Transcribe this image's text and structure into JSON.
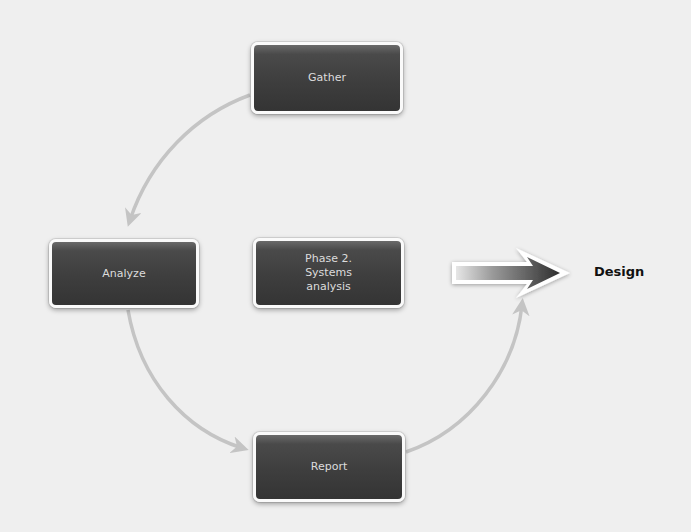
{
  "diagram": {
    "nodes": [
      {
        "id": "gather",
        "label": "Gather"
      },
      {
        "id": "analyze",
        "label": "Analyze"
      },
      {
        "id": "phase",
        "label": "Phase 2. Systems analysis",
        "lines": [
          "Phase 2.",
          "Systems",
          "analysis"
        ]
      },
      {
        "id": "report",
        "label": "Report"
      }
    ],
    "edges": [
      {
        "from": "Gather",
        "to": "Analyze",
        "style": "curved-arrow"
      },
      {
        "from": "Analyze",
        "to": "Report",
        "style": "curved-arrow"
      },
      {
        "from": "Report",
        "to": "Design",
        "style": "curved-arrow"
      },
      {
        "from": "Phase 2. Systems analysis",
        "to": "Design",
        "style": "block-arrow"
      }
    ],
    "target": {
      "label": "Design"
    },
    "colors": {
      "background": "#efefef",
      "node_fill": "#3e3e3e",
      "node_border": "#fafafa",
      "node_text": "#dcdcdc",
      "connector": "#c4c4c4",
      "target_text": "#111111"
    }
  }
}
